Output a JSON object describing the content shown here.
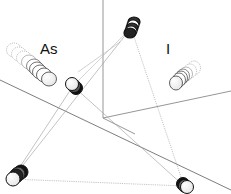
{
  "diagram": {
    "type": "3d-crystal-structure-schematic",
    "labels": {
      "as": "As",
      "i": "I"
    },
    "colors": {
      "background": "#ffffff",
      "atom_outline": "#111111",
      "atom_fill": "#ffffff",
      "ghost_outline": "#9a9a9a",
      "axis_line": "#8a8a8a",
      "bond_line": "#9a9a9a"
    },
    "atoms": [
      {
        "name": "top-atom",
        "x": 131,
        "y": 28
      },
      {
        "name": "middle-atom",
        "x": 73,
        "y": 86
      },
      {
        "name": "bottom-left-atom",
        "x": 12,
        "y": 179
      },
      {
        "name": "bottom-right-atom",
        "x": 184,
        "y": 186
      }
    ],
    "ghost_stacks": [
      {
        "name": "as-ghost-stack",
        "from": {
          "x": 13,
          "y": 49
        },
        "to": {
          "x": 50,
          "y": 80
        }
      },
      {
        "name": "i-ghost-stack",
        "from": {
          "x": 196,
          "y": 68
        },
        "to": {
          "x": 174,
          "y": 83
        }
      }
    ]
  }
}
